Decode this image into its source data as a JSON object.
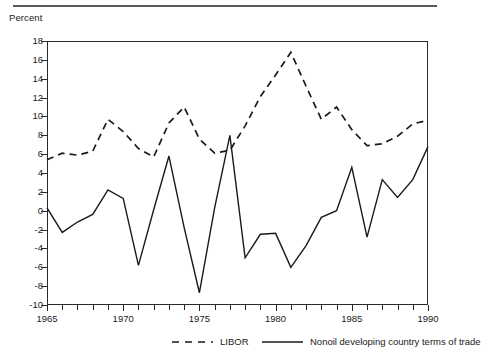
{
  "figure": {
    "unit_label": "Percent"
  },
  "chart_data": {
    "type": "line",
    "title": "",
    "subtitle": "",
    "xlabel": "",
    "ylabel": "Percent",
    "xlim": [
      1965,
      1990
    ],
    "ylim": [
      -10,
      18
    ],
    "ytick_step": 2,
    "yticks": [
      18,
      16,
      14,
      12,
      10,
      8,
      6,
      4,
      2,
      0,
      -2,
      -4,
      -6,
      -8,
      -10
    ],
    "ytick_labels": [
      "18",
      "16",
      "14",
      "12",
      "10",
      "8",
      "6",
      "4",
      "2",
      "0",
      "-2",
      "-4",
      "-6",
      "-8",
      "-10"
    ],
    "xticks": [
      1965,
      1966,
      1967,
      1968,
      1969,
      1970,
      1971,
      1972,
      1973,
      1974,
      1975,
      1976,
      1977,
      1978,
      1979,
      1980,
      1981,
      1982,
      1983,
      1984,
      1985,
      1986,
      1987,
      1988,
      1989,
      1990
    ],
    "xtick_labels_shown": [
      "1965",
      "1970",
      "1975",
      "1980",
      "1985",
      "1990"
    ],
    "xtick_labels_shown_values": [
      1965,
      1970,
      1975,
      1980,
      1985,
      1990
    ],
    "grid": false,
    "frame": true,
    "legend_position": "below",
    "x": [
      1965,
      1966,
      1967,
      1968,
      1969,
      1970,
      1971,
      1972,
      1973,
      1974,
      1975,
      1976,
      1977,
      1978,
      1979,
      1980,
      1981,
      1982,
      1983,
      1984,
      1985,
      1986,
      1987,
      1988,
      1989,
      1990
    ],
    "series": [
      {
        "name": "LIBOR",
        "style": "dashed",
        "color": "#1a1a1a",
        "values": [
          5.4,
          6.1,
          5.9,
          6.3,
          9.7,
          8.4,
          6.6,
          5.7,
          9.3,
          11.0,
          7.6,
          6.1,
          6.4,
          9.0,
          12.1,
          14.4,
          16.8,
          13.2,
          9.7,
          11.0,
          8.6,
          6.9,
          7.1,
          7.9,
          9.2,
          9.6
        ]
      },
      {
        "name": "Nonoil developing country terms of trade",
        "style": "solid",
        "color": "#1a1a1a",
        "values": [
          0.3,
          -2.3,
          -1.2,
          -0.4,
          2.2,
          1.3,
          -5.8,
          0.1,
          5.8,
          -1.8,
          -8.7,
          0.3,
          8.0,
          -5.0,
          -2.5,
          -2.4,
          -6.0,
          -3.7,
          -0.7,
          0.0,
          4.6,
          -2.8,
          3.3,
          1.4,
          3.3,
          6.8
        ]
      }
    ]
  },
  "legend": {
    "entries": [
      {
        "label": "LIBOR",
        "style": "dashed"
      },
      {
        "label": "Nonoil developing country terms of trade",
        "style": "solid"
      }
    ]
  }
}
